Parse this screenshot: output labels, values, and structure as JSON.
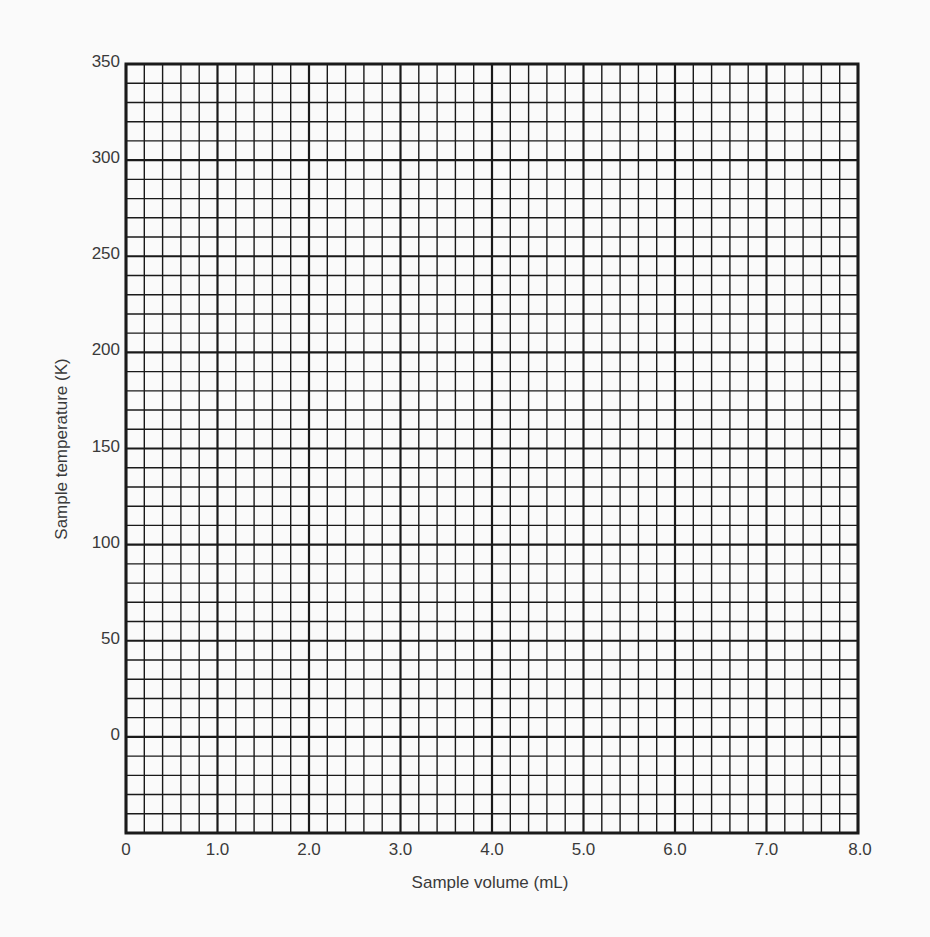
{
  "chart_data": {
    "type": "scatter",
    "title": "",
    "xlabel": "Sample volume (mL)",
    "ylabel": "Sample temperature (K)",
    "xlim": [
      0,
      8.0
    ],
    "ylim": [
      -50,
      350
    ],
    "x_ticks": [
      "0",
      "1.0",
      "2.0",
      "3.0",
      "4.0",
      "5.0",
      "6.0",
      "7.0",
      "8.0"
    ],
    "x_tick_values": [
      0,
      1,
      2,
      3,
      4,
      5,
      6,
      7,
      8
    ],
    "y_ticks": [
      "350",
      "300",
      "250",
      "200",
      "150",
      "100",
      "50",
      "0"
    ],
    "y_tick_values": [
      350,
      300,
      250,
      200,
      150,
      100,
      50,
      0
    ],
    "grid": true,
    "minor_x_step": 0.2,
    "minor_y_step": 10,
    "major_x_step": 1.0,
    "major_y_step": 50,
    "series": [],
    "note": "Blank graph paper grid; no data points plotted"
  },
  "colors": {
    "grid_line": "#1a1a1a",
    "background": "#fafafa",
    "text": "#3a3a3a"
  }
}
